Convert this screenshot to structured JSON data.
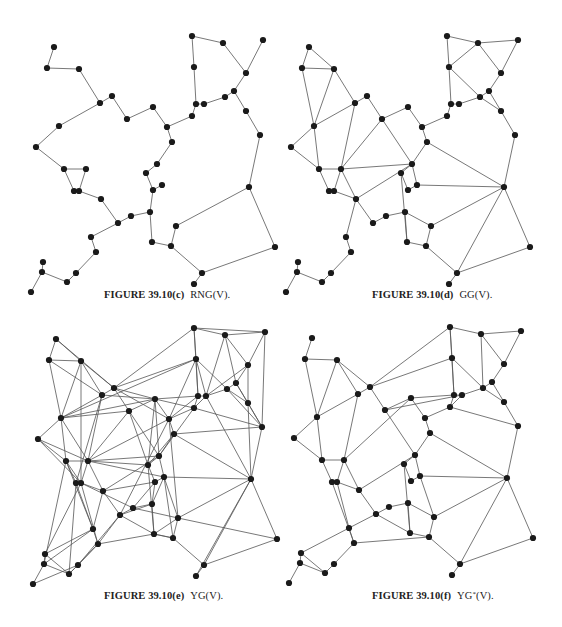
{
  "points": [
    [
      54,
      47
    ],
    [
      47,
      68
    ],
    [
      79,
      69
    ],
    [
      100,
      103
    ],
    [
      112,
      96
    ],
    [
      127,
      119
    ],
    [
      59,
      126
    ],
    [
      36,
      147
    ],
    [
      153,
      107
    ],
    [
      192,
      36
    ],
    [
      223,
      43
    ],
    [
      263,
      40
    ],
    [
      246,
      73
    ],
    [
      194,
      67
    ],
    [
      234,
      91
    ],
    [
      225,
      97
    ],
    [
      204,
      104
    ],
    [
      196,
      104
    ],
    [
      192,
      116
    ],
    [
      167,
      127
    ],
    [
      172,
      142
    ],
    [
      246,
      111
    ],
    [
      260,
      135
    ],
    [
      64,
      169
    ],
    [
      86,
      169
    ],
    [
      74,
      191
    ],
    [
      79,
      191
    ],
    [
      101,
      199
    ],
    [
      118,
      223
    ],
    [
      131,
      216
    ],
    [
      150,
      212
    ],
    [
      152,
      242
    ],
    [
      91,
      237
    ],
    [
      96,
      252
    ],
    [
      76,
      273
    ],
    [
      67,
      282
    ],
    [
      42,
      272
    ],
    [
      43,
      262
    ],
    [
      31,
      292
    ],
    [
      157,
      164
    ],
    [
      146,
      173
    ],
    [
      153,
      190
    ],
    [
      162,
      185
    ],
    [
      176,
      226
    ],
    [
      171,
      246
    ],
    [
      249,
      187
    ],
    [
      275,
      247
    ],
    [
      202,
      273
    ],
    [
      194,
      284
    ]
  ],
  "panels": [
    {
      "id": "c",
      "figure_label": "FIGURE 39.10(c)",
      "graph_name": "RNG(V).",
      "graph_type": "Relative Neighborhood Graph",
      "edges": [
        [
          0,
          1
        ],
        [
          1,
          2
        ],
        [
          2,
          3
        ],
        [
          3,
          4
        ],
        [
          4,
          5
        ],
        [
          5,
          8
        ],
        [
          3,
          6
        ],
        [
          6,
          7
        ],
        [
          7,
          23
        ],
        [
          23,
          24
        ],
        [
          24,
          26
        ],
        [
          23,
          25
        ],
        [
          25,
          26
        ],
        [
          26,
          27
        ],
        [
          27,
          28
        ],
        [
          28,
          29
        ],
        [
          29,
          30
        ],
        [
          30,
          31
        ],
        [
          28,
          32
        ],
        [
          32,
          33
        ],
        [
          33,
          34
        ],
        [
          34,
          35
        ],
        [
          35,
          36
        ],
        [
          36,
          37
        ],
        [
          36,
          38
        ],
        [
          8,
          19
        ],
        [
          19,
          18
        ],
        [
          18,
          17
        ],
        [
          17,
          13
        ],
        [
          13,
          9
        ],
        [
          9,
          10
        ],
        [
          10,
          12
        ],
        [
          12,
          11
        ],
        [
          12,
          14
        ],
        [
          14,
          15
        ],
        [
          15,
          16
        ],
        [
          16,
          17
        ],
        [
          14,
          21
        ],
        [
          21,
          22
        ],
        [
          22,
          45
        ],
        [
          45,
          46
        ],
        [
          46,
          47
        ],
        [
          47,
          48
        ],
        [
          45,
          43
        ],
        [
          43,
          44
        ],
        [
          44,
          31
        ],
        [
          47,
          44
        ],
        [
          19,
          20
        ],
        [
          20,
          39
        ],
        [
          39,
          40
        ],
        [
          40,
          41
        ],
        [
          41,
          42
        ],
        [
          41,
          30
        ]
      ]
    },
    {
      "id": "d",
      "figure_label": "FIGURE 39.10(d)",
      "graph_name": "GG(V).",
      "graph_type": "Gabriel Graph",
      "edges": [
        [
          0,
          1
        ],
        [
          0,
          2
        ],
        [
          1,
          2
        ],
        [
          1,
          6
        ],
        [
          2,
          6
        ],
        [
          2,
          3
        ],
        [
          3,
          4
        ],
        [
          3,
          6
        ],
        [
          4,
          5
        ],
        [
          5,
          8
        ],
        [
          6,
          7
        ],
        [
          7,
          23
        ],
        [
          6,
          23
        ],
        [
          3,
          24
        ],
        [
          23,
          24
        ],
        [
          24,
          26
        ],
        [
          23,
          25
        ],
        [
          25,
          26
        ],
        [
          24,
          27
        ],
        [
          26,
          27
        ],
        [
          5,
          24
        ],
        [
          5,
          39
        ],
        [
          24,
          39
        ],
        [
          27,
          28
        ],
        [
          28,
          29
        ],
        [
          29,
          30
        ],
        [
          30,
          31
        ],
        [
          27,
          32
        ],
        [
          32,
          33
        ],
        [
          33,
          34
        ],
        [
          34,
          35
        ],
        [
          35,
          36
        ],
        [
          36,
          37
        ],
        [
          36,
          38
        ],
        [
          27,
          39
        ],
        [
          8,
          19
        ],
        [
          19,
          18
        ],
        [
          18,
          17
        ],
        [
          17,
          13
        ],
        [
          13,
          9
        ],
        [
          9,
          10
        ],
        [
          10,
          13
        ],
        [
          10,
          12
        ],
        [
          10,
          11
        ],
        [
          11,
          12
        ],
        [
          12,
          14
        ],
        [
          13,
          15
        ],
        [
          14,
          15
        ],
        [
          15,
          16
        ],
        [
          16,
          17
        ],
        [
          14,
          21
        ],
        [
          15,
          21
        ],
        [
          21,
          22
        ],
        [
          22,
          45
        ],
        [
          20,
          45
        ],
        [
          19,
          20
        ],
        [
          20,
          39
        ],
        [
          39,
          40
        ],
        [
          40,
          41
        ],
        [
          41,
          42
        ],
        [
          39,
          42
        ],
        [
          42,
          45
        ],
        [
          45,
          43
        ],
        [
          45,
          46
        ],
        [
          45,
          47
        ],
        [
          46,
          47
        ],
        [
          47,
          48
        ],
        [
          43,
          44
        ],
        [
          44,
          31
        ],
        [
          47,
          44
        ],
        [
          30,
          43
        ],
        [
          31,
          40
        ]
      ]
    },
    {
      "id": "e",
      "figure_label": "FIGURE 39.10(e)",
      "graph_name": "YG(V).",
      "graph_type": "Yao Graph",
      "edges": [
        [
          0,
          1
        ],
        [
          0,
          2
        ],
        [
          0,
          4
        ],
        [
          1,
          2
        ],
        [
          1,
          6
        ],
        [
          1,
          3
        ],
        [
          2,
          3
        ],
        [
          2,
          4
        ],
        [
          2,
          6
        ],
        [
          2,
          26
        ],
        [
          3,
          4
        ],
        [
          3,
          6
        ],
        [
          3,
          24
        ],
        [
          3,
          25
        ],
        [
          3,
          8
        ],
        [
          4,
          5
        ],
        [
          4,
          9
        ],
        [
          4,
          13
        ],
        [
          4,
          8
        ],
        [
          4,
          19
        ],
        [
          5,
          8
        ],
        [
          5,
          24
        ],
        [
          5,
          39
        ],
        [
          5,
          6
        ],
        [
          5,
          40
        ],
        [
          6,
          7
        ],
        [
          6,
          23
        ],
        [
          6,
          24
        ],
        [
          6,
          8
        ],
        [
          6,
          13
        ],
        [
          7,
          23
        ],
        [
          7,
          24
        ],
        [
          7,
          26
        ],
        [
          8,
          19
        ],
        [
          8,
          17
        ],
        [
          8,
          18
        ],
        [
          8,
          40
        ],
        [
          8,
          39
        ],
        [
          9,
          10
        ],
        [
          9,
          13
        ],
        [
          9,
          11
        ],
        [
          9,
          17
        ],
        [
          10,
          12
        ],
        [
          10,
          11
        ],
        [
          10,
          14
        ],
        [
          10,
          16
        ],
        [
          11,
          12
        ],
        [
          11,
          22
        ],
        [
          12,
          14
        ],
        [
          12,
          21
        ],
        [
          12,
          16
        ],
        [
          13,
          15
        ],
        [
          13,
          17
        ],
        [
          13,
          19
        ],
        [
          13,
          16
        ],
        [
          14,
          15
        ],
        [
          14,
          21
        ],
        [
          14,
          22
        ],
        [
          15,
          16
        ],
        [
          15,
          21
        ],
        [
          15,
          22
        ],
        [
          16,
          17
        ],
        [
          16,
          18
        ],
        [
          16,
          45
        ],
        [
          17,
          18
        ],
        [
          17,
          19
        ],
        [
          18,
          19
        ],
        [
          18,
          22
        ],
        [
          18,
          39
        ],
        [
          19,
          20
        ],
        [
          19,
          24
        ],
        [
          19,
          28
        ],
        [
          19,
          43
        ],
        [
          20,
          39
        ],
        [
          20,
          40
        ],
        [
          20,
          45
        ],
        [
          20,
          22
        ],
        [
          21,
          22
        ],
        [
          21,
          45
        ],
        [
          22,
          45
        ],
        [
          23,
          24
        ],
        [
          23,
          25
        ],
        [
          23,
          26
        ],
        [
          23,
          32
        ],
        [
          23,
          36
        ],
        [
          24,
          26
        ],
        [
          24,
          27
        ],
        [
          24,
          39
        ],
        [
          24,
          40
        ],
        [
          24,
          42
        ],
        [
          25,
          26
        ],
        [
          25,
          32
        ],
        [
          25,
          35
        ],
        [
          26,
          27
        ],
        [
          26,
          29
        ],
        [
          26,
          33
        ],
        [
          26,
          37
        ],
        [
          27,
          28
        ],
        [
          27,
          39
        ],
        [
          27,
          41
        ],
        [
          27,
          32
        ],
        [
          28,
          29
        ],
        [
          28,
          30
        ],
        [
          28,
          31
        ],
        [
          28,
          33
        ],
        [
          28,
          34
        ],
        [
          29,
          30
        ],
        [
          29,
          41
        ],
        [
          29,
          43
        ],
        [
          30,
          31
        ],
        [
          30,
          41
        ],
        [
          30,
          42
        ],
        [
          31,
          40
        ],
        [
          31,
          44
        ],
        [
          31,
          43
        ],
        [
          31,
          33
        ],
        [
          32,
          33
        ],
        [
          32,
          36
        ],
        [
          33,
          34
        ],
        [
          33,
          35
        ],
        [
          34,
          35
        ],
        [
          34,
          38
        ],
        [
          35,
          36
        ],
        [
          35,
          37
        ],
        [
          36,
          37
        ],
        [
          36,
          38
        ],
        [
          37,
          32
        ],
        [
          39,
          40
        ],
        [
          39,
          42
        ],
        [
          40,
          41
        ],
        [
          41,
          42
        ],
        [
          42,
          45
        ],
        [
          42,
          44
        ],
        [
          42,
          43
        ],
        [
          43,
          44
        ],
        [
          43,
          45
        ],
        [
          44,
          47
        ],
        [
          45,
          46
        ],
        [
          45,
          47
        ],
        [
          45,
          48
        ],
        [
          46,
          47
        ],
        [
          46,
          43
        ],
        [
          47,
          48
        ],
        [
          44,
          31
        ]
      ]
    },
    {
      "id": "f",
      "figure_label": "FIGURE 39.10(f)",
      "graph_name": "YG",
      "graph_name_sup": "*",
      "graph_name_suffix": "(V).",
      "graph_type": "Yao Graph variant",
      "edges": [
        [
          0,
          1
        ],
        [
          1,
          2
        ],
        [
          1,
          6
        ],
        [
          2,
          6
        ],
        [
          2,
          3
        ],
        [
          2,
          4
        ],
        [
          3,
          4
        ],
        [
          3,
          6
        ],
        [
          4,
          5
        ],
        [
          4,
          9
        ],
        [
          4,
          13
        ],
        [
          5,
          8
        ],
        [
          5,
          16
        ],
        [
          6,
          7
        ],
        [
          6,
          23
        ],
        [
          3,
          24
        ],
        [
          7,
          23
        ],
        [
          23,
          24
        ],
        [
          24,
          26
        ],
        [
          23,
          25
        ],
        [
          25,
          26
        ],
        [
          24,
          27
        ],
        [
          26,
          27
        ],
        [
          5,
          39
        ],
        [
          24,
          8
        ],
        [
          27,
          28
        ],
        [
          27,
          39
        ],
        [
          28,
          29
        ],
        [
          29,
          30
        ],
        [
          30,
          31
        ],
        [
          28,
          32
        ],
        [
          32,
          33
        ],
        [
          33,
          34
        ],
        [
          34,
          35
        ],
        [
          35,
          36
        ],
        [
          36,
          37
        ],
        [
          36,
          38
        ],
        [
          35,
          37
        ],
        [
          32,
          37
        ],
        [
          25,
          33
        ],
        [
          26,
          32
        ],
        [
          33,
          44
        ],
        [
          28,
          31
        ],
        [
          31,
          40
        ],
        [
          40,
          41
        ],
        [
          41,
          42
        ],
        [
          39,
          42
        ],
        [
          39,
          40
        ],
        [
          31,
          44
        ],
        [
          8,
          19
        ],
        [
          8,
          17
        ],
        [
          19,
          18
        ],
        [
          18,
          17
        ],
        [
          17,
          13
        ],
        [
          13,
          9
        ],
        [
          9,
          10
        ],
        [
          9,
          17
        ],
        [
          10,
          12
        ],
        [
          10,
          11
        ],
        [
          11,
          12
        ],
        [
          12,
          14
        ],
        [
          13,
          15
        ],
        [
          10,
          15
        ],
        [
          14,
          15
        ],
        [
          15,
          16
        ],
        [
          16,
          17
        ],
        [
          14,
          21
        ],
        [
          15,
          21
        ],
        [
          21,
          22
        ],
        [
          22,
          45
        ],
        [
          18,
          22
        ],
        [
          16,
          18
        ],
        [
          19,
          20
        ],
        [
          20,
          39
        ],
        [
          20,
          45
        ],
        [
          42,
          45
        ],
        [
          45,
          43
        ],
        [
          45,
          46
        ],
        [
          45,
          47
        ],
        [
          46,
          47
        ],
        [
          47,
          48
        ],
        [
          43,
          44
        ],
        [
          47,
          44
        ],
        [
          30,
          43
        ],
        [
          42,
          43
        ]
      ]
    }
  ]
}
